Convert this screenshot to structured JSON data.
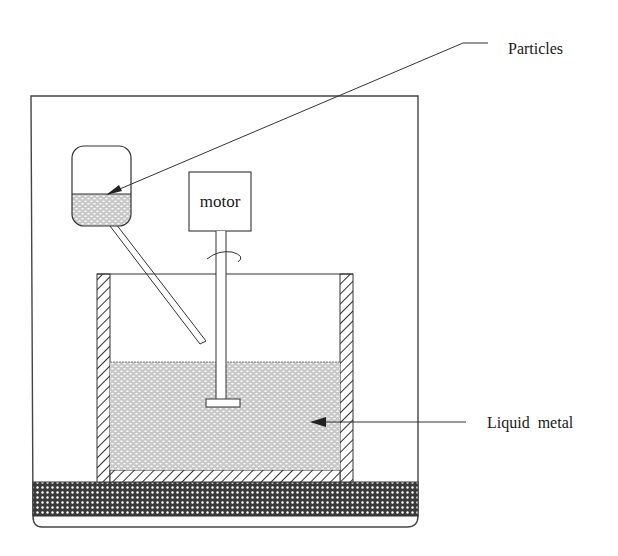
{
  "diagram": {
    "type": "apparatus-schematic",
    "labels": {
      "particles": "Particles",
      "liquid_metal": "Liquid metal",
      "motor": "motor"
    },
    "components": [
      {
        "id": "enclosure",
        "name": "Outer enclosure/furnace"
      },
      {
        "id": "hopper",
        "name": "Particle hopper"
      },
      {
        "id": "feed-tube",
        "name": "Feed tube"
      },
      {
        "id": "motor",
        "name": "Motor"
      },
      {
        "id": "shaft",
        "name": "Stirrer shaft"
      },
      {
        "id": "impeller",
        "name": "Impeller blade"
      },
      {
        "id": "crucible",
        "name": "Crucible"
      },
      {
        "id": "liquid-metal",
        "name": "Liquid metal melt"
      },
      {
        "id": "base",
        "name": "Heated base plate"
      }
    ],
    "colors": {
      "stroke": "#333333",
      "fill_dots": "#9a9a9a",
      "background": "#ffffff"
    }
  }
}
